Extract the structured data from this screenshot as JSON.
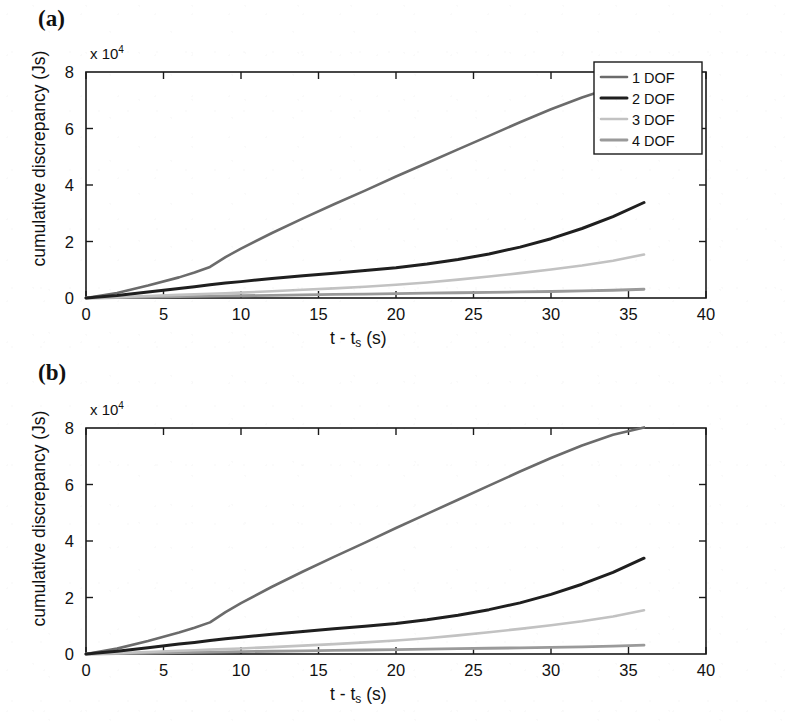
{
  "figure": {
    "panels": [
      {
        "id": "a",
        "label": "(a)",
        "exponent_label": "x 10",
        "exponent_sup": "4"
      },
      {
        "id": "b",
        "label": "(b)",
        "exponent_label": "x 10",
        "exponent_sup": "4"
      }
    ],
    "axis_titles": {
      "y": "cumulative discrepancy (Js)",
      "x_prefix": "t - t",
      "x_sub": "s",
      "x_suffix": " (s)"
    }
  },
  "legend": {
    "position": "top-right",
    "entries": [
      {
        "label": "1 DOF",
        "color": "#6b6b6b"
      },
      {
        "label": "2 DOF",
        "color": "#1f1f1f"
      },
      {
        "label": "3 DOF",
        "color": "#c2c2c2"
      },
      {
        "label": "4 DOF",
        "color": "#9a9a9a"
      }
    ]
  },
  "chart_data": [
    {
      "type": "line",
      "panel": "a",
      "title": "(a)",
      "xlabel": "t - t_s (s)",
      "ylabel": "cumulative discrepancy (Js)",
      "y_multiplier": "x 10^4",
      "xlim": [
        0,
        40
      ],
      "ylim": [
        0,
        80000
      ],
      "xticks": [
        0,
        5,
        10,
        15,
        20,
        25,
        30,
        35,
        40
      ],
      "xticklabels": [
        "0",
        "5",
        "10",
        "15",
        "20",
        "25",
        "30",
        "35",
        "40"
      ],
      "yticks": [
        0,
        20000,
        40000,
        60000,
        80000
      ],
      "yticklabels": [
        "0",
        "2",
        "4",
        "6",
        "8"
      ],
      "grid": false,
      "x": [
        0,
        2,
        4,
        6,
        7,
        8,
        9,
        10,
        12,
        14,
        16,
        18,
        20,
        22,
        24,
        26,
        28,
        30,
        32,
        34,
        36
      ],
      "series": [
        {
          "name": "1 DOF",
          "color": "#6b6b6b",
          "width": 2.6,
          "values": [
            0,
            1800,
            4400,
            7300,
            9000,
            11000,
            14500,
            17500,
            23000,
            28200,
            33200,
            38000,
            43000,
            47800,
            52600,
            57400,
            62200,
            66800,
            71000,
            74600,
            77000
          ]
        },
        {
          "name": "2 DOF",
          "color": "#1f1f1f",
          "width": 3.0,
          "values": [
            0,
            900,
            2100,
            3400,
            4000,
            4700,
            5300,
            5800,
            6900,
            7900,
            8800,
            9700,
            10700,
            12000,
            13600,
            15600,
            18000,
            21000,
            24600,
            28800,
            33800
          ]
        },
        {
          "name": "3 DOF",
          "color": "#c2c2c2",
          "width": 2.6,
          "values": [
            0,
            300,
            700,
            1100,
            1300,
            1500,
            1700,
            1900,
            2400,
            2900,
            3400,
            4000,
            4700,
            5500,
            6500,
            7600,
            8800,
            10100,
            11500,
            13200,
            15400
          ]
        },
        {
          "name": "4 DOF",
          "color": "#9a9a9a",
          "width": 2.8,
          "values": [
            0,
            150,
            320,
            480,
            560,
            640,
            720,
            800,
            960,
            1100,
            1250,
            1400,
            1550,
            1700,
            1850,
            2000,
            2150,
            2300,
            2500,
            2750,
            3100
          ]
        }
      ]
    },
    {
      "type": "line",
      "panel": "b",
      "title": "(b)",
      "xlabel": "t - t_s (s)",
      "ylabel": "cumulative discrepancy (Js)",
      "y_multiplier": "x 10^4",
      "xlim": [
        0,
        40
      ],
      "ylim": [
        0,
        80000
      ],
      "xticks": [
        0,
        5,
        10,
        15,
        20,
        25,
        30,
        35,
        40
      ],
      "xticklabels": [
        "0",
        "5",
        "10",
        "15",
        "20",
        "25",
        "30",
        "35",
        "40"
      ],
      "yticks": [
        0,
        20000,
        40000,
        60000,
        80000
      ],
      "yticklabels": [
        "0",
        "2",
        "4",
        "6",
        "8"
      ],
      "grid": false,
      "x": [
        0,
        2,
        4,
        6,
        7,
        8,
        9,
        10,
        12,
        14,
        16,
        18,
        20,
        22,
        24,
        26,
        28,
        30,
        32,
        34,
        36
      ],
      "series": [
        {
          "name": "1 DOF",
          "color": "#6b6b6b",
          "width": 2.6,
          "values": [
            0,
            1900,
            4600,
            7600,
            9300,
            11200,
            14800,
            18000,
            23800,
            29200,
            34400,
            39400,
            44600,
            49600,
            54600,
            59600,
            64600,
            69400,
            73800,
            77600,
            80200
          ]
        },
        {
          "name": "2 DOF",
          "color": "#1f1f1f",
          "width": 3.0,
          "values": [
            0,
            950,
            2200,
            3500,
            4100,
            4800,
            5400,
            5900,
            7000,
            8000,
            8900,
            9800,
            10800,
            12100,
            13700,
            15700,
            18100,
            21100,
            24700,
            28900,
            33900
          ]
        },
        {
          "name": "3 DOF",
          "color": "#c2c2c2",
          "width": 2.6,
          "values": [
            0,
            300,
            700,
            1150,
            1350,
            1550,
            1750,
            1950,
            2450,
            2950,
            3500,
            4100,
            4800,
            5600,
            6600,
            7700,
            8900,
            10200,
            11600,
            13300,
            15500
          ]
        },
        {
          "name": "4 DOF",
          "color": "#9a9a9a",
          "width": 2.8,
          "values": [
            0,
            150,
            330,
            500,
            580,
            660,
            740,
            820,
            980,
            1120,
            1270,
            1420,
            1570,
            1720,
            1880,
            2030,
            2180,
            2340,
            2540,
            2800,
            3150
          ]
        }
      ]
    }
  ]
}
